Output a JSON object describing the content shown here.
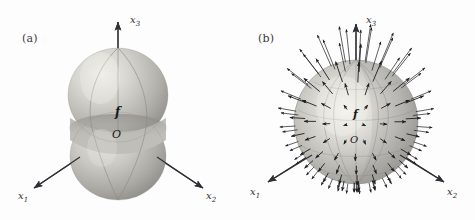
{
  "figure": {
    "background_color": "#fdfdfd",
    "ink_color": "#2f2f35",
    "surface_color": "#b6b6b2",
    "highlight_color": "#f0efe9",
    "shadow_color": "#7b7b79"
  },
  "panels": [
    {
      "id": "a",
      "label": "(a)",
      "caption_letter": "a",
      "object": "peanut-shaped-surface",
      "origin_label": "O",
      "function_label": "f",
      "axes": [
        {
          "name": "x3",
          "label": "x",
          "subscript": "3",
          "direction": "up"
        },
        {
          "name": "x1",
          "label": "x",
          "subscript": "1",
          "direction": "down-left"
        },
        {
          "name": "x2",
          "label": "x",
          "subscript": "2",
          "direction": "down-right"
        }
      ]
    },
    {
      "id": "b",
      "label": "(b)",
      "caption_letter": "b",
      "object": "sphere-with-radial-vector-field",
      "origin_label": "O",
      "function_label": "f",
      "axes": [
        {
          "name": "x3",
          "label": "x",
          "subscript": "3",
          "direction": "up"
        },
        {
          "name": "x1",
          "label": "x",
          "subscript": "1",
          "direction": "down-left"
        },
        {
          "name": "x2",
          "label": "x",
          "subscript": "2",
          "direction": "down-right"
        }
      ],
      "vector_field": {
        "description": "radial arrows normal to sphere surface, longest near north pole",
        "arrow_count": 120,
        "arrow_color": "#1d1d20"
      }
    }
  ],
  "chart_data": {
    "type": "scatter",
    "title": "",
    "xlabel": "",
    "ylabel": "",
    "series": [
      {
        "name": "panel-a-surface",
        "description": "spherical-polar radial plot r(theta) of a function f, axially symmetric about x3, forming a peanut/dumbbell with a waist at the equator",
        "theta_deg": [
          0,
          15,
          30,
          45,
          60,
          75,
          90,
          105,
          120,
          135,
          150,
          165,
          180
        ],
        "r": [
          1.0,
          0.99,
          0.96,
          0.9,
          0.82,
          0.74,
          0.7,
          0.74,
          0.82,
          0.9,
          0.96,
          0.99,
          1.0
        ]
      },
      {
        "name": "panel-b-vector-field",
        "description": "outward normal vectors on a unit sphere; arrow length varies with polar angle, maximal near the north pole",
        "theta_deg": [
          0,
          20,
          40,
          60,
          80,
          100,
          120,
          140,
          160,
          180
        ],
        "arrow_length": [
          0.62,
          0.58,
          0.5,
          0.4,
          0.3,
          0.24,
          0.2,
          0.18,
          0.16,
          0.15
        ]
      }
    ]
  }
}
